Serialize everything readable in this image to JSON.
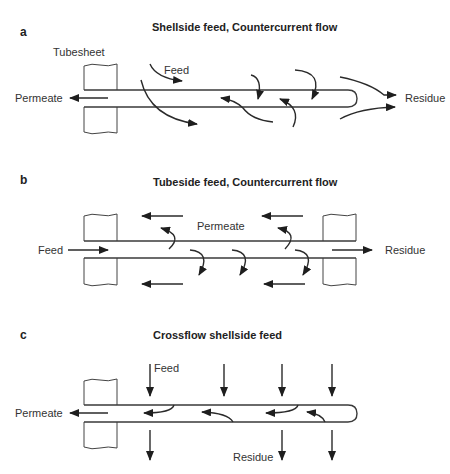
{
  "panels": [
    {
      "letter": "a",
      "title": "Shellside feed, Countercurrent flow",
      "labels": {
        "tubesheet": "Tubesheet",
        "feed": "Feed",
        "permeate": "Permeate",
        "residue": "Residue"
      }
    },
    {
      "letter": "b",
      "title": "Tubeside feed, Countercurrent flow",
      "labels": {
        "feed": "Feed",
        "permeate": "Permeate",
        "residue": "Residue"
      }
    },
    {
      "letter": "c",
      "title": "Crossflow shellside feed",
      "labels": {
        "feed": "Feed",
        "permeate": "Permeate",
        "residue": "Residue"
      }
    }
  ],
  "colors": {
    "line": "#3a3a3a",
    "text": "#333333",
    "background": "#ffffff"
  }
}
